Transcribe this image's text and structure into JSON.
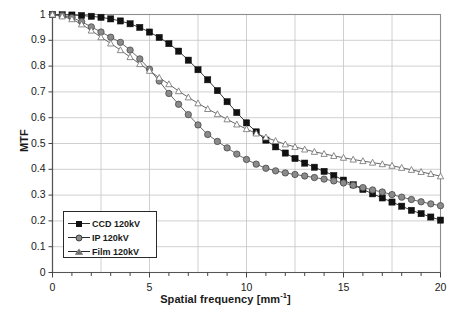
{
  "chart_data": {
    "type": "line",
    "title": "",
    "xlabel": "Spatial frequency [mm",
    "xlabel_sup": "-1",
    "xlabel_suffix": "]",
    "ylabel": "MTF",
    "xlim": [
      0,
      20
    ],
    "ylim": [
      0,
      1
    ],
    "xticks": [
      "0",
      "5",
      "10",
      "15",
      "20"
    ],
    "xtick_values": [
      0,
      5,
      10,
      15,
      20
    ],
    "xminor_step": 1,
    "yticks": [
      "0",
      "0.1",
      "0.2",
      "0.3",
      "0.4",
      "0.5",
      "0.6",
      "0.7",
      "0.8",
      "0.9",
      "1"
    ],
    "ytick_values": [
      0,
      0.1,
      0.2,
      0.3,
      0.4,
      0.5,
      0.6,
      0.7,
      0.8,
      0.9,
      1
    ],
    "grid": true,
    "grid_x_step": 2.5,
    "grid_y_step": 0.1,
    "legend_position": "lower left",
    "x": [
      0,
      0.5,
      1,
      1.5,
      2,
      2.5,
      3,
      3.5,
      4,
      4.5,
      5,
      5.5,
      6,
      6.5,
      7,
      7.5,
      8,
      8.5,
      9,
      9.5,
      10,
      10.5,
      11,
      11.5,
      12,
      12.5,
      13,
      13.5,
      14,
      14.5,
      15,
      15.5,
      16,
      16.5,
      17,
      17.5,
      18,
      18.5,
      19,
      19.5,
      20
    ],
    "series": [
      {
        "name": "CCD 120kV",
        "marker": "filled-square",
        "color": "#111111",
        "values": [
          1.0,
          0.999,
          0.998,
          0.996,
          0.993,
          0.989,
          0.983,
          0.975,
          0.964,
          0.95,
          0.932,
          0.911,
          0.887,
          0.858,
          0.823,
          0.786,
          0.747,
          0.705,
          0.662,
          0.62,
          0.58,
          0.545,
          0.513,
          0.487,
          0.463,
          0.442,
          0.424,
          0.408,
          0.392,
          0.376,
          0.358,
          0.34,
          0.322,
          0.305,
          0.289,
          0.273,
          0.257,
          0.241,
          0.228,
          0.215,
          0.203
        ]
      },
      {
        "name": "IP 120kV",
        "marker": "filled-circle",
        "color": "#8a8a8a",
        "values": [
          1.0,
          0.996,
          0.988,
          0.972,
          0.952,
          0.932,
          0.912,
          0.892,
          0.862,
          0.828,
          0.788,
          0.742,
          0.694,
          0.652,
          0.612,
          0.572,
          0.535,
          0.508,
          0.483,
          0.459,
          0.438,
          0.42,
          0.404,
          0.394,
          0.386,
          0.38,
          0.374,
          0.368,
          0.362,
          0.355,
          0.347,
          0.338,
          0.329,
          0.32,
          0.312,
          0.302,
          0.292,
          0.283,
          0.274,
          0.266,
          0.259
        ]
      },
      {
        "name": "Film 120kV",
        "marker": "open-triangle",
        "color": "#9a9a9a",
        "values": [
          1.0,
          0.993,
          0.982,
          0.962,
          0.938,
          0.912,
          0.888,
          0.862,
          0.835,
          0.808,
          0.782,
          0.755,
          0.73,
          0.703,
          0.679,
          0.656,
          0.634,
          0.614,
          0.594,
          0.574,
          0.556,
          0.539,
          0.524,
          0.51,
          0.497,
          0.487,
          0.477,
          0.468,
          0.46,
          0.452,
          0.445,
          0.438,
          0.432,
          0.426,
          0.42,
          0.414,
          0.406,
          0.398,
          0.39,
          0.382,
          0.373
        ]
      }
    ]
  },
  "legend": {
    "items": [
      {
        "label": "CCD 120kV"
      },
      {
        "label": "IP 120kV"
      },
      {
        "label": "Film 120kV"
      }
    ]
  }
}
